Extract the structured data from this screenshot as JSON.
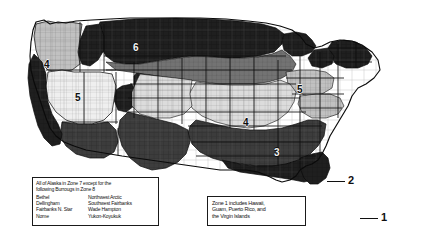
{
  "map": {
    "title": "United States Climate Zone Map",
    "description": "Grayscale county-level map of the contiguous United States divided into numbered climate zones",
    "zone_labels": [
      {
        "id": "zone-label-4-pacific-northwest",
        "value": "4",
        "x": 44,
        "y": 60,
        "shade": "light"
      },
      {
        "id": "zone-label-5-great-basin",
        "value": "5",
        "x": 75,
        "y": 93,
        "shade": "light"
      },
      {
        "id": "zone-label-6-northern-plains",
        "value": "6",
        "x": 133,
        "y": 43,
        "shade": "dark"
      },
      {
        "id": "zone-label-4-midwest",
        "value": "4",
        "x": 243,
        "y": 118,
        "shade": "light"
      },
      {
        "id": "zone-label-5-ohio-valley",
        "value": "5",
        "x": 297,
        "y": 85,
        "shade": "light"
      },
      {
        "id": "zone-label-3-southeast",
        "value": "3",
        "x": 274,
        "y": 148,
        "shade": "dark"
      }
    ],
    "callouts": [
      {
        "id": "callout-zone-2",
        "value": "2",
        "label_x": 348,
        "label_y": 175,
        "line_x": 327,
        "line_y": 181,
        "line_w": 18
      },
      {
        "id": "callout-zone-1",
        "value": "1",
        "label_x": 381,
        "label_y": 212,
        "line_x": 360,
        "line_y": 218,
        "line_w": 18
      }
    ]
  },
  "notes": {
    "alaska": {
      "name": "alaska-note",
      "line1": "All of Alaska in Zone 7 except for the",
      "line2": "following Burrougs in Zone 8",
      "boroughs_left": [
        "Bethel",
        "Dellingham",
        "Fairbanks N. Star",
        "Nome"
      ],
      "boroughs_right": [
        "Northwest Arctic",
        "Southwest Fairbanks",
        "Wade Hampton",
        "Yukon-Koyukuk"
      ]
    },
    "zone1": {
      "name": "zone-1-note",
      "line1": "Zone 1 includes Hawaii,",
      "line2": "Guam, Puerto Rico, and",
      "line3": "the Virgin Islands"
    }
  },
  "colors": {
    "background": "#ffffff",
    "zone_very_dark": "#1c1c1c",
    "zone_dark": "#3a3a3a",
    "zone_mid": "#6e6e6e",
    "zone_light": "#b4b4b4",
    "zone_very_light": "#d9d9d9",
    "zone_palest": "#efefef",
    "outline": "#0d0d0d",
    "county_line": "#7d7d7d",
    "note_border": "#1a1a1a",
    "note_text": "#101010"
  }
}
